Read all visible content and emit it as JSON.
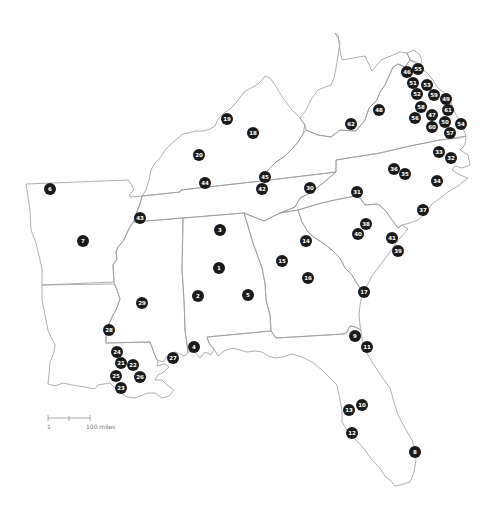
{
  "map": {
    "type": "numbered-location-map",
    "region": "Southeastern United States",
    "marker_color": "#1a1a1a",
    "marker_text_color": "#ffffff",
    "border_color": "#9a9a9a",
    "markers": [
      {
        "id": "1",
        "x": 219,
        "y": 268
      },
      {
        "id": "2",
        "x": 198,
        "y": 296
      },
      {
        "id": "3",
        "x": 220,
        "y": 230
      },
      {
        "id": "4",
        "x": 194,
        "y": 347
      },
      {
        "id": "5",
        "x": 248,
        "y": 295
      },
      {
        "id": "6",
        "x": 50,
        "y": 189
      },
      {
        "id": "7",
        "x": 83,
        "y": 241
      },
      {
        "id": "8",
        "x": 415,
        "y": 452
      },
      {
        "id": "9",
        "x": 355,
        "y": 336
      },
      {
        "id": "10",
        "x": 362,
        "y": 405
      },
      {
        "id": "11",
        "x": 367,
        "y": 347
      },
      {
        "id": "12",
        "x": 352,
        "y": 433
      },
      {
        "id": "13",
        "x": 349,
        "y": 410
      },
      {
        "id": "14",
        "x": 306,
        "y": 241
      },
      {
        "id": "15",
        "x": 282,
        "y": 261
      },
      {
        "id": "16",
        "x": 308,
        "y": 278
      },
      {
        "id": "17",
        "x": 364,
        "y": 292
      },
      {
        "id": "18",
        "x": 253,
        "y": 133
      },
      {
        "id": "19",
        "x": 227,
        "y": 119
      },
      {
        "id": "20",
        "x": 199,
        "y": 155
      },
      {
        "id": "21",
        "x": 121,
        "y": 363
      },
      {
        "id": "22",
        "x": 133,
        "y": 365
      },
      {
        "id": "23",
        "x": 121,
        "y": 388
      },
      {
        "id": "24",
        "x": 117,
        "y": 352
      },
      {
        "id": "25",
        "x": 116,
        "y": 376
      },
      {
        "id": "26",
        "x": 140,
        "y": 377
      },
      {
        "id": "27",
        "x": 173,
        "y": 358
      },
      {
        "id": "28",
        "x": 109,
        "y": 330
      },
      {
        "id": "29",
        "x": 142,
        "y": 303
      },
      {
        "id": "30",
        "x": 310,
        "y": 188
      },
      {
        "id": "31",
        "x": 357,
        "y": 192
      },
      {
        "id": "32",
        "x": 451,
        "y": 158
      },
      {
        "id": "33",
        "x": 439,
        "y": 152
      },
      {
        "id": "34",
        "x": 437,
        "y": 181
      },
      {
        "id": "35",
        "x": 405,
        "y": 174
      },
      {
        "id": "36",
        "x": 394,
        "y": 169
      },
      {
        "id": "37",
        "x": 423,
        "y": 210
      },
      {
        "id": "38",
        "x": 366,
        "y": 224
      },
      {
        "id": "39",
        "x": 398,
        "y": 251
      },
      {
        "id": "40",
        "x": 358,
        "y": 234
      },
      {
        "id": "41",
        "x": 392,
        "y": 238
      },
      {
        "id": "42",
        "x": 262,
        "y": 189
      },
      {
        "id": "43",
        "x": 140,
        "y": 218
      },
      {
        "id": "44",
        "x": 205,
        "y": 183
      },
      {
        "id": "45",
        "x": 265,
        "y": 177
      },
      {
        "id": "46",
        "x": 407,
        "y": 72
      },
      {
        "id": "47",
        "x": 432,
        "y": 115
      },
      {
        "id": "48",
        "x": 379,
        "y": 110
      },
      {
        "id": "49",
        "x": 446,
        "y": 99
      },
      {
        "id": "50",
        "x": 445,
        "y": 122
      },
      {
        "id": "51",
        "x": 413,
        "y": 83
      },
      {
        "id": "52",
        "x": 417,
        "y": 94
      },
      {
        "id": "53",
        "x": 427,
        "y": 85
      },
      {
        "id": "54",
        "x": 461,
        "y": 124
      },
      {
        "id": "55",
        "x": 418,
        "y": 69
      },
      {
        "id": "56",
        "x": 415,
        "y": 118
      },
      {
        "id": "57",
        "x": 450,
        "y": 133
      },
      {
        "id": "58",
        "x": 421,
        "y": 107
      },
      {
        "id": "59",
        "x": 434,
        "y": 95
      },
      {
        "id": "60",
        "x": 432,
        "y": 127
      },
      {
        "id": "61",
        "x": 448,
        "y": 110
      },
      {
        "id": "62",
        "x": 351,
        "y": 124
      }
    ],
    "scale_bar": {
      "start_label": "1",
      "end_label": "100 miles"
    }
  }
}
